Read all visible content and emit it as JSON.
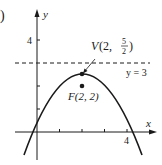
{
  "figure": {
    "part_label": ")",
    "axes": {
      "x_label": "x",
      "y_label": "y",
      "x_tick_label": "4",
      "y_tick_label": "4"
    },
    "directrix": {
      "label": "y = 3",
      "equation": "y = 3"
    },
    "vertex": {
      "label_prefix": "V",
      "label_coords": "(2, ",
      "frac_num": "5",
      "frac_den": "2",
      "label_close": ")",
      "x": 2,
      "y": 2.5
    },
    "focus": {
      "label": "F(2, 2)",
      "x": 2,
      "y": 2
    },
    "parabola": {
      "opens": "down",
      "vertex": [
        2,
        2.5
      ],
      "focus": [
        2,
        2
      ],
      "directrix_y": 3
    },
    "colors": {
      "ink": "#1a1a1a",
      "background": "#ffffff"
    }
  }
}
